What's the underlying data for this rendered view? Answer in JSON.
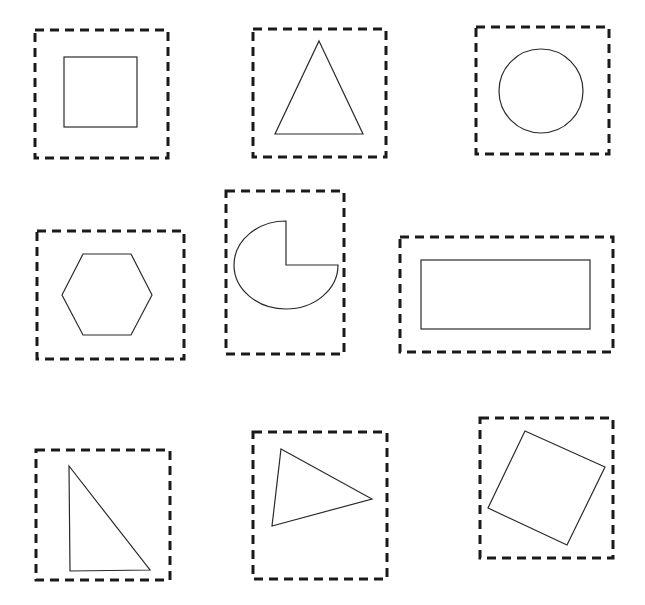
{
  "diagram": {
    "title": "",
    "background": "#ffffff",
    "frame_color": "#1a1a1a",
    "shape_stroke_color": "#2a2a2a",
    "cells": [
      {
        "id": "square",
        "shape": "square",
        "frame": {
          "x": 35,
          "y": 30,
          "w": 133,
          "h": 128
        },
        "geometry": {
          "x": 64,
          "y": 57,
          "w": 73,
          "h": 70
        }
      },
      {
        "id": "triangle",
        "shape": "isosceles-triangle",
        "frame": {
          "x": 253,
          "y": 29,
          "w": 133,
          "h": 128
        },
        "geometry": {
          "points": "319,41 363,134 275,134"
        }
      },
      {
        "id": "circle",
        "shape": "circle",
        "frame": {
          "x": 476,
          "y": 27,
          "w": 133,
          "h": 127
        },
        "geometry": {
          "cx": 541,
          "cy": 91,
          "r": 42
        }
      },
      {
        "id": "hexagon",
        "shape": "hexagon",
        "frame": {
          "x": 37,
          "y": 231,
          "w": 147,
          "h": 128
        },
        "geometry": {
          "points": "62,295 83,254 131,254 152,295 131,335 83,335"
        }
      },
      {
        "id": "pac-shape",
        "shape": "ellipse-with-quarter-cutout",
        "frame": {
          "x": 226,
          "y": 191,
          "w": 118,
          "h": 163
        },
        "geometry": {
          "d": "M 286 221 L 286 265 L 338 265 A 52 44 0 1 1 286 221 Z"
        }
      },
      {
        "id": "rectangle",
        "shape": "rectangle",
        "frame": {
          "x": 400,
          "y": 237,
          "w": 213,
          "h": 115
        },
        "geometry": {
          "x": 421,
          "y": 260,
          "w": 169,
          "h": 69
        }
      },
      {
        "id": "right-triangle",
        "shape": "right-triangle",
        "frame": {
          "x": 36,
          "y": 450,
          "w": 134,
          "h": 130
        },
        "geometry": {
          "points": "69,466 150,570 70,571"
        }
      },
      {
        "id": "scalene-triangle",
        "shape": "scalene-triangle",
        "frame": {
          "x": 253,
          "y": 432,
          "w": 134,
          "h": 147
        },
        "geometry": {
          "points": "281,449 372,499 272,526"
        }
      },
      {
        "id": "rotated-square",
        "shape": "rotated-square",
        "frame": {
          "x": 480,
          "y": 418,
          "w": 133,
          "h": 140
        },
        "geometry": {
          "points": "525,431 605,467 567,545 488,508"
        }
      }
    ]
  }
}
